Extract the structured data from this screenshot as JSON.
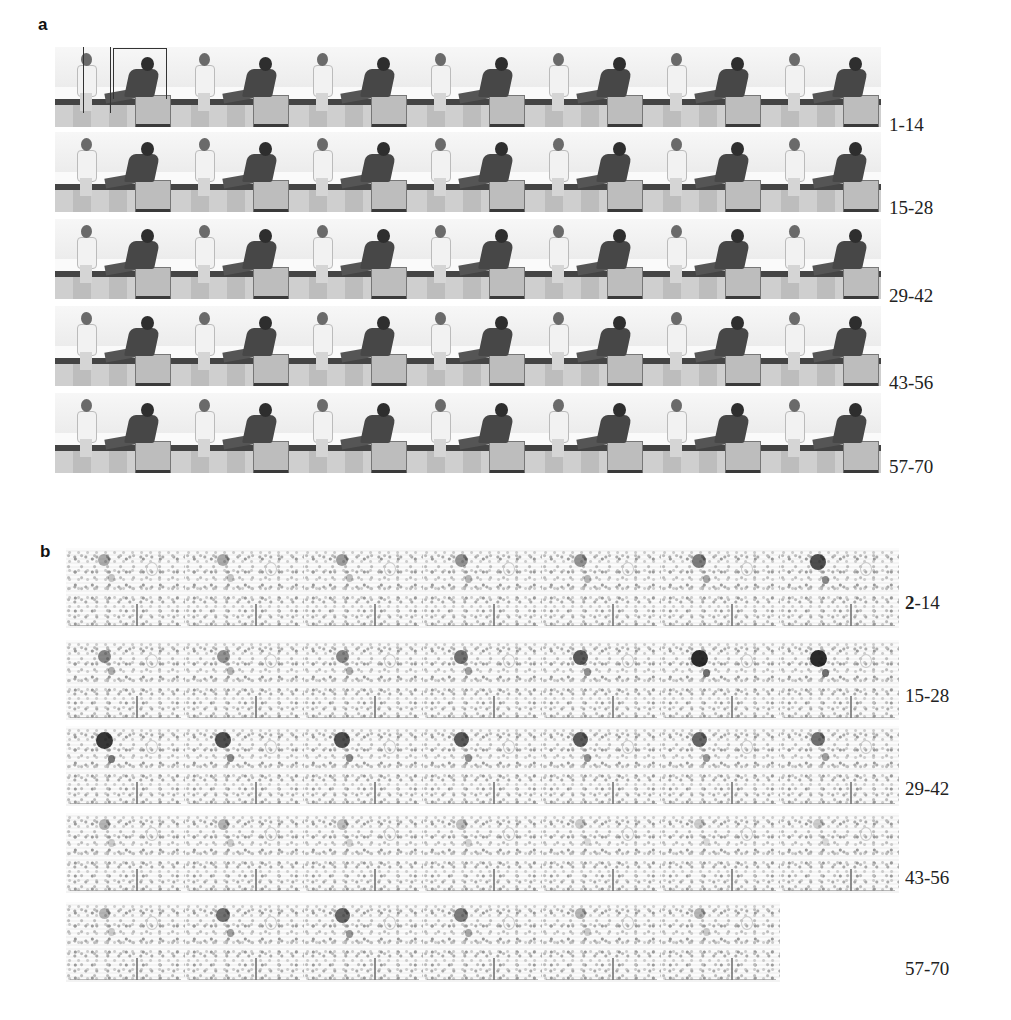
{
  "figure": {
    "panels": [
      {
        "label": "a",
        "description": "Video frame sequence: girl and boy seated on benches",
        "rows": [
          {
            "label": "1-14"
          },
          {
            "label": "15-28"
          },
          {
            "label": "29-42"
          },
          {
            "label": "43-56"
          },
          {
            "label": "57-70"
          }
        ],
        "pairs_per_row": 7
      },
      {
        "label": "b",
        "description": "Frame difference images",
        "rows": [
          {
            "label_bold": "2",
            "label_rest": "-14"
          },
          {
            "label": "15-28"
          },
          {
            "label": "29-42"
          },
          {
            "label": "43-56"
          },
          {
            "label": "57-70"
          }
        ],
        "pairs_per_row": 7,
        "last_row_pairs": 6
      }
    ]
  }
}
